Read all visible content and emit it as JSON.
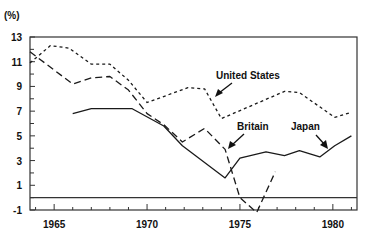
{
  "chart_data": {
    "type": "line",
    "title": "",
    "ylabel": "(%)",
    "xlabel": "",
    "xlim": [
      1963.7,
      1981.3
    ],
    "ylim": [
      -1,
      13
    ],
    "yticks": [
      -1,
      1,
      3,
      5,
      7,
      9,
      11,
      13
    ],
    "xticks": [
      1965,
      1970,
      1975,
      1980
    ],
    "grid": false,
    "zero_line": true,
    "legend": "inline annotations with arrows",
    "series": [
      {
        "name": "United States",
        "style": "short-dash",
        "x": [
          1963.7,
          1964.8,
          1965.8,
          1967.0,
          1968.0,
          1969.0,
          1970.0,
          1972.2,
          1973.1,
          1974.0,
          1977.4,
          1978.2,
          1980.1,
          1981.0
        ],
        "y": [
          10.9,
          12.3,
          12.1,
          10.8,
          10.8,
          9.5,
          7.7,
          8.9,
          8.8,
          6.4,
          8.6,
          8.5,
          6.5,
          6.9
        ]
      },
      {
        "name": "Britain",
        "style": "long-dash",
        "x": [
          1963.7,
          1966.0,
          1967.0,
          1968.0,
          1969.0,
          1970.0,
          1970.9,
          1971.9,
          1973.1,
          1974.2,
          1975.0,
          1975.9,
          1976.9
        ],
        "y": [
          11.8,
          9.2,
          9.7,
          9.8,
          8.7,
          6.8,
          5.9,
          4.5,
          5.6,
          3.9,
          0.0,
          -1.2,
          2.1
        ]
      },
      {
        "name": "Japan",
        "style": "solid",
        "x": [
          1966.0,
          1967.0,
          1969.2,
          1970.9,
          1971.9,
          1974.2,
          1975.0,
          1976.4,
          1977.4,
          1978.2,
          1979.3,
          1980.1,
          1981.0
        ],
        "y": [
          6.8,
          7.2,
          7.2,
          5.8,
          4.2,
          1.6,
          3.2,
          3.7,
          3.4,
          3.8,
          3.3,
          4.2,
          5.0
        ]
      }
    ],
    "annotations": [
      {
        "text": "United States",
        "points_to": "United States"
      },
      {
        "text": "Britain",
        "points_to": "Britain"
      },
      {
        "text": "Japan",
        "points_to": "Japan"
      }
    ]
  },
  "labels": {
    "y_unit": "(%)",
    "us": "United States",
    "britain": "Britain",
    "japan": "Japan"
  },
  "colors": {
    "line": "#1a1a1a",
    "axis": "#333333",
    "background": "#ffffff"
  }
}
